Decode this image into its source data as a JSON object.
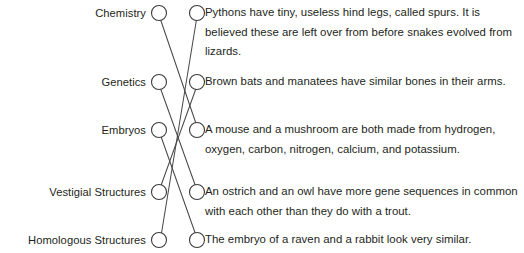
{
  "worksheet": {
    "type": "matching-exercise",
    "left_column_heading": "",
    "right_column_heading": "",
    "left_items": [
      {
        "id": "L1",
        "label": "Chemistry"
      },
      {
        "id": "L2",
        "label": "Genetics"
      },
      {
        "id": "L3",
        "label": "Embryos"
      },
      {
        "id": "L4",
        "label": "Vestigial Structures"
      },
      {
        "id": "L5",
        "label": "Homologous Structures"
      }
    ],
    "right_items": [
      {
        "id": "R1",
        "text": "Pythons have tiny, useless hind legs, called spurs. It is believed these are left over from before snakes evolved from lizards."
      },
      {
        "id": "R2",
        "text": "Brown bats and manatees have similar bones in their arms."
      },
      {
        "id": "R3",
        "text": "A mouse and a mushroom are both made from hydrogen, oxygen, carbon, nitrogen, calcium, and potassium."
      },
      {
        "id": "R4",
        "text": "An ostrich and an owl have more gene sequences in common with each other than they do with a trout."
      },
      {
        "id": "R5",
        "text": "The embryo of a raven and a rabbit look very similar."
      }
    ],
    "connections": [
      {
        "from": "L1",
        "to": "R3"
      },
      {
        "from": "L2",
        "to": "R4"
      },
      {
        "from": "L3",
        "to": "R5"
      },
      {
        "from": "L4",
        "to": "R2"
      },
      {
        "from": "L5",
        "to": "R1"
      }
    ],
    "colors": {
      "ink": "#231f20",
      "line": "#4a4a4a",
      "bubble_stroke": "#3a3a3a",
      "background": "#ffffff"
    },
    "geometry": {
      "left_bubble_x": 159,
      "right_bubble_x": 197,
      "bubble_radius": 7.5,
      "row_y": [
        13,
        82,
        130,
        192,
        240
      ]
    }
  }
}
